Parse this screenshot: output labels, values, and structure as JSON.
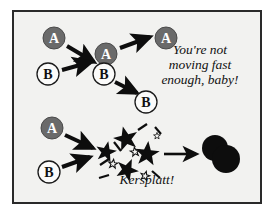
{
  "figure": {
    "name": "collision-cartoon-diagram",
    "background_color": "#ffffff",
    "panel": {
      "background_color": "#f2f2f0",
      "border_color": "#2a2a2a"
    },
    "colors": {
      "node_a_fill": "#6a6a6a",
      "node_a_stroke": "#4a4a4a",
      "node_a_text": "#ffffff",
      "node_b_fill": "#fbfbfa",
      "node_b_stroke": "#1a1a1a",
      "node_b_text": "#111111",
      "arrow": "#0d0d0d",
      "burst": "#0d0d0d",
      "blob": "#0d0d0d"
    }
  },
  "captions": {
    "quote": "You're not\nmoving fast\nenough, baby!",
    "impact": "Kersplatt!"
  },
  "scene_top": {
    "name": "glancing-pass-scene",
    "nodes": [
      {
        "id": "a-incoming",
        "label": "A",
        "kind": "dark",
        "cx": 40,
        "cy": 26,
        "r": 11
      },
      {
        "id": "b-incoming",
        "label": "B",
        "kind": "light",
        "cx": 34,
        "cy": 62,
        "r": 11
      },
      {
        "id": "a-meeting",
        "label": "A",
        "kind": "dark",
        "cx": 92,
        "cy": 42,
        "r": 11
      },
      {
        "id": "b-meeting",
        "label": "B",
        "kind": "light",
        "cx": 90,
        "cy": 62,
        "r": 11
      },
      {
        "id": "a-outgoing",
        "label": "A",
        "kind": "dark",
        "cx": 152,
        "cy": 26,
        "r": 11
      },
      {
        "id": "b-outgoing",
        "label": "B",
        "kind": "light",
        "cx": 132,
        "cy": 90,
        "r": 11
      }
    ],
    "arrows": [
      {
        "id": "a-in-arrow",
        "x1": 53,
        "y1": 34,
        "x2": 80,
        "y2": 50
      },
      {
        "id": "b-in-arrow",
        "x1": 48,
        "y1": 58,
        "x2": 77,
        "y2": 50
      },
      {
        "id": "a-out-arrow",
        "x1": 106,
        "y1": 36,
        "x2": 138,
        "y2": 25
      },
      {
        "id": "b-out-arrow",
        "x1": 101,
        "y1": 70,
        "x2": 124,
        "y2": 82
      }
    ]
  },
  "scene_bottom": {
    "name": "collision-merge-scene",
    "nodes": [
      {
        "id": "a-collider",
        "label": "A",
        "kind": "dark",
        "cx": 38,
        "cy": 116,
        "r": 11
      },
      {
        "id": "b-collider",
        "label": "B",
        "kind": "light",
        "cx": 35,
        "cy": 160,
        "r": 11
      }
    ],
    "arrows": [
      {
        "id": "a-collide-arrow",
        "x1": 51,
        "y1": 123,
        "x2": 81,
        "y2": 137
      },
      {
        "id": "b-collide-arrow",
        "x1": 48,
        "y1": 155,
        "x2": 78,
        "y2": 144
      },
      {
        "id": "merge-arrow",
        "x1": 137,
        "y1": 142,
        "x2": 186,
        "y2": 142
      }
    ],
    "burst": {
      "id": "impact-burst",
      "big_stars": [
        {
          "cx": 92,
          "cy": 140,
          "r": 11,
          "rot": 12
        },
        {
          "cx": 112,
          "cy": 127,
          "r": 13,
          "rot": -14
        },
        {
          "cx": 113,
          "cy": 158,
          "r": 12,
          "rot": 24
        },
        {
          "cx": 133,
          "cy": 142,
          "r": 13,
          "rot": 6
        }
      ],
      "small_stars": [
        {
          "cx": 99,
          "cy": 152,
          "r": 4.5,
          "rot": 8
        },
        {
          "cx": 121,
          "cy": 140,
          "r": 4.5,
          "rot": -8
        },
        {
          "cx": 131,
          "cy": 164,
          "r": 4.5,
          "rot": 16
        },
        {
          "cx": 142,
          "cy": 124,
          "r": 3.5,
          "rot": 0
        }
      ],
      "sparks": [
        {
          "x1": 86,
          "y1": 153,
          "x2": 95,
          "y2": 147
        },
        {
          "x1": 100,
          "y1": 131,
          "x2": 107,
          "y2": 139
        },
        {
          "x1": 124,
          "y1": 118,
          "x2": 133,
          "y2": 113
        },
        {
          "x1": 141,
          "y1": 116,
          "x2": 146,
          "y2": 122
        },
        {
          "x1": 138,
          "y1": 159,
          "x2": 146,
          "y2": 166
        },
        {
          "x1": 86,
          "y1": 166,
          "x2": 95,
          "y2": 163
        }
      ]
    },
    "merged_blob": {
      "id": "merged-blob",
      "lobes": [
        {
          "cx": 201,
          "cy": 136,
          "r": 13
        },
        {
          "cx": 212,
          "cy": 147,
          "r": 14
        }
      ]
    }
  }
}
